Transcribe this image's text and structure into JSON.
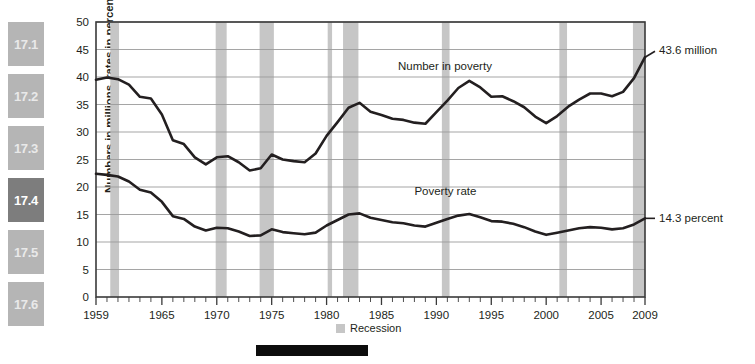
{
  "sidebar": {
    "items": [
      {
        "label": "17.1",
        "active": false
      },
      {
        "label": "17.2",
        "active": false
      },
      {
        "label": "17.3",
        "active": false
      },
      {
        "label": "17.4",
        "active": true
      },
      {
        "label": "17.5",
        "active": false
      },
      {
        "label": "17.6",
        "active": false
      }
    ]
  },
  "legend": {
    "recession_label": "Recession",
    "recession_color": "#c6c6c6"
  },
  "chart_data": {
    "type": "line",
    "title": "",
    "xlabel": "",
    "ylabel": "Numbers in millions, rates in percent",
    "xlim": [
      1959,
      2009
    ],
    "ylim": [
      0,
      50
    ],
    "yticks": [
      0,
      5,
      10,
      15,
      20,
      25,
      30,
      35,
      40,
      45,
      50
    ],
    "xticks": [
      1959,
      1965,
      1970,
      1975,
      1980,
      1985,
      1990,
      1995,
      2000,
      2005,
      2009
    ],
    "grid": true,
    "legend_position": "bottom-center",
    "line_color": "#231f20",
    "x": [
      1959,
      1960,
      1961,
      1962,
      1963,
      1964,
      1965,
      1966,
      1967,
      1968,
      1969,
      1970,
      1971,
      1972,
      1973,
      1974,
      1975,
      1976,
      1977,
      1978,
      1979,
      1980,
      1981,
      1982,
      1983,
      1984,
      1985,
      1986,
      1987,
      1988,
      1989,
      1990,
      1991,
      1992,
      1993,
      1994,
      1995,
      1996,
      1997,
      1998,
      1999,
      2000,
      2001,
      2002,
      2003,
      2004,
      2005,
      2006,
      2007,
      2008,
      2009
    ],
    "series": [
      {
        "name": "Number in poverty",
        "unit": "millions",
        "annotation": "Number in poverty",
        "end_label": "43.6 million",
        "values": [
          39.5,
          39.9,
          39.6,
          38.6,
          36.4,
          36.1,
          33.2,
          28.5,
          27.8,
          25.4,
          24.1,
          25.4,
          25.6,
          24.5,
          23.0,
          23.4,
          25.9,
          25.0,
          24.7,
          24.5,
          26.1,
          29.3,
          31.8,
          34.4,
          35.3,
          33.7,
          33.1,
          32.4,
          32.2,
          31.7,
          31.5,
          33.6,
          35.7,
          38.0,
          39.3,
          38.1,
          36.4,
          36.5,
          35.6,
          34.5,
          32.8,
          31.6,
          32.9,
          34.6,
          35.9,
          37.0,
          37.0,
          36.5,
          37.3,
          39.8,
          43.6
        ]
      },
      {
        "name": "Poverty rate",
        "unit": "percent",
        "annotation": "Poverty rate",
        "end_label": "14.3 percent",
        "values": [
          22.4,
          22.2,
          21.9,
          21.0,
          19.5,
          19.0,
          17.3,
          14.7,
          14.2,
          12.8,
          12.1,
          12.6,
          12.5,
          11.9,
          11.1,
          11.2,
          12.3,
          11.8,
          11.6,
          11.4,
          11.7,
          13.0,
          14.0,
          15.0,
          15.2,
          14.4,
          14.0,
          13.6,
          13.4,
          13.0,
          12.8,
          13.5,
          14.2,
          14.8,
          15.1,
          14.5,
          13.8,
          13.7,
          13.3,
          12.7,
          11.9,
          11.3,
          11.7,
          12.1,
          12.5,
          12.7,
          12.6,
          12.3,
          12.5,
          13.2,
          14.3
        ]
      }
    ],
    "recessions": [
      {
        "start": 1960.3,
        "end": 1961.1
      },
      {
        "start": 1969.9,
        "end": 1970.9
      },
      {
        "start": 1973.9,
        "end": 1975.2
      },
      {
        "start": 1980.1,
        "end": 1980.5
      },
      {
        "start": 1981.5,
        "end": 1982.9
      },
      {
        "start": 1990.5,
        "end": 1991.2
      },
      {
        "start": 2001.2,
        "end": 2001.9
      },
      {
        "start": 2007.9,
        "end": 2009.4
      }
    ]
  }
}
